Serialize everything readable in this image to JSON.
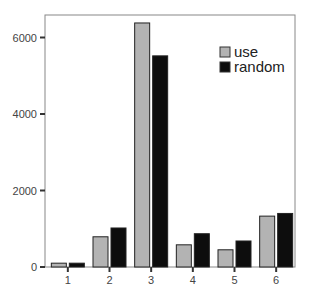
{
  "chart_data": {
    "type": "bar",
    "title": "",
    "xlabel": "",
    "ylabel": "",
    "categories": [
      "1",
      "2",
      "3",
      "4",
      "5",
      "6"
    ],
    "series": [
      {
        "name": "use",
        "color": "#b3b3b3",
        "values": [
          100,
          790,
          6380,
          580,
          450,
          1330
        ]
      },
      {
        "name": "random",
        "color": "#0d0d0d",
        "values": [
          100,
          1020,
          5520,
          870,
          680,
          1400
        ]
      }
    ],
    "ylim": [
      0,
      6600
    ],
    "yticks": [
      0,
      2000,
      4000,
      6000
    ],
    "grid": false,
    "legend_position": "upper right"
  },
  "legend": {
    "items": [
      {
        "label": "use",
        "color": "#b3b3b3"
      },
      {
        "label": "random",
        "color": "#0d0d0d"
      }
    ]
  }
}
